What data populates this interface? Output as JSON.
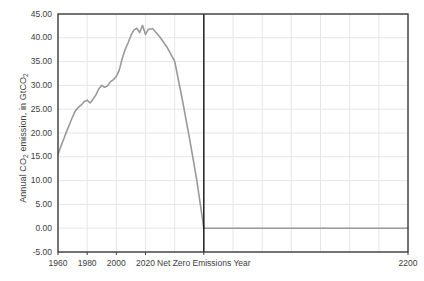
{
  "chart_data": {
    "type": "line",
    "title": "",
    "xlabel": "",
    "ylabel": "Annual CO2 emission, in GtCO2",
    "ylabel_parts": {
      "pre": "Annual CO",
      "sub1": "2",
      "mid": " emission, in GtCO",
      "sub2": "2"
    },
    "xlim": [
      1960,
      2200
    ],
    "ylim": [
      -5,
      45
    ],
    "grid": true,
    "legend": null,
    "yticks": [
      45.0,
      40.0,
      35.0,
      30.0,
      25.0,
      20.0,
      15.0,
      10.0,
      5.0,
      0.0,
      -5.0
    ],
    "ytick_labels": [
      "45.00",
      "40.00",
      "35.00",
      "30.00",
      "25.00",
      "20.00",
      "15.00",
      "10.00",
      "5.00",
      "0.00",
      "-5.00"
    ],
    "xticks": [
      1960,
      1980,
      2000,
      2020,
      2060,
      2200
    ],
    "xtick_labels": [
      "1960",
      "1980",
      "2000",
      "2020",
      "Net Zero Emissions Year",
      "2200"
    ],
    "annotations": [
      {
        "name": "net-zero-emissions-year-line",
        "type": "vline",
        "x": 2060,
        "label": "Net Zero Emissions Year",
        "color": "#000000"
      }
    ],
    "series": [
      {
        "name": "Annual CO2 emission",
        "color": "#9a9a9a",
        "x": [
          1960,
          1962,
          1964,
          1966,
          1968,
          1970,
          1972,
          1974,
          1976,
          1978,
          1980,
          1982,
          1984,
          1986,
          1988,
          1990,
          1992,
          1994,
          1996,
          1998,
          2000,
          2002,
          2004,
          2006,
          2008,
          2010,
          2012,
          2014,
          2016,
          2018,
          2020,
          2022,
          2025,
          2030,
          2035,
          2040,
          2045,
          2050,
          2055,
          2060,
          2080,
          2100,
          2150,
          2200
        ],
        "values": [
          15.5,
          17.2,
          18.8,
          20.4,
          21.9,
          23.4,
          24.7,
          25.4,
          25.9,
          26.6,
          26.9,
          26.3,
          27.1,
          28.0,
          29.3,
          30.0,
          29.6,
          29.9,
          30.8,
          31.2,
          31.9,
          33.2,
          35.6,
          37.5,
          38.9,
          40.5,
          41.6,
          42.0,
          41.1,
          42.6,
          40.7,
          41.8,
          41.9,
          40.1,
          37.9,
          35.1,
          27.4,
          19.2,
          10.4,
          0.0,
          0.0,
          0.0,
          0.0,
          0.0
        ]
      }
    ],
    "colors": {
      "line": "#9a9a9a",
      "grid": "#e6e6e6",
      "axis": "#3d3d3d",
      "marker_line": "#000000",
      "background": "#ffffff"
    }
  }
}
